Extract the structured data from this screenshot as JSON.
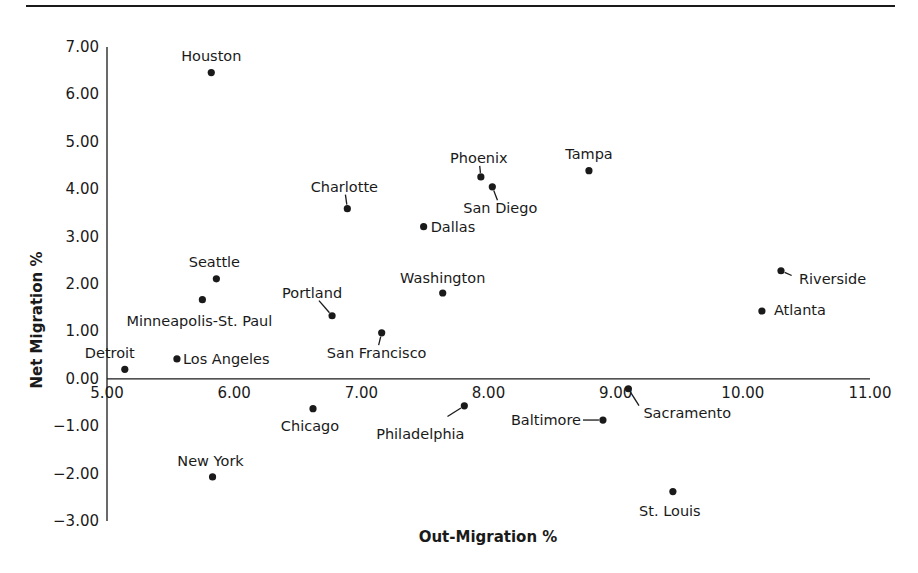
{
  "chart_data": {
    "type": "scatter",
    "title": "",
    "xlabel": "Out-Migration %",
    "ylabel": "Net Migration %",
    "xlim": [
      5.0,
      11.0
    ],
    "ylim": [
      -3.0,
      7.0
    ],
    "x_ticks": [
      "5.00",
      "6.00",
      "7.00",
      "8.00",
      "9.00",
      "10.00",
      "11.00"
    ],
    "y_ticks": [
      "7.00",
      "6.00",
      "5.00",
      "4.00",
      "3.00",
      "2.00",
      "1.00",
      "0.00",
      "-1.00",
      "-2.00",
      "-3.00"
    ],
    "grid": false,
    "legend": "none",
    "x_axis_crosses_at": 0.0,
    "points": [
      {
        "name": "Houston",
        "x": 5.82,
        "y": 6.46,
        "label_dx": 0,
        "label_dy": -12,
        "anchor": "middle",
        "leader": false
      },
      {
        "name": "Charlotte",
        "x": 6.89,
        "y": 3.59,
        "label_dx": -3,
        "label_dy": -17,
        "anchor": "middle",
        "leader": true
      },
      {
        "name": "Phoenix",
        "x": 7.94,
        "y": 4.26,
        "label_dx": -2,
        "label_dy": -14,
        "anchor": "middle",
        "leader": true
      },
      {
        "name": "San Diego",
        "x": 8.03,
        "y": 4.05,
        "label_dx": 8,
        "label_dy": 26,
        "anchor": "middle",
        "leader": true
      },
      {
        "name": "Tampa",
        "x": 8.79,
        "y": 4.39,
        "label_dx": 0,
        "label_dy": -12,
        "anchor": "middle",
        "leader": false
      },
      {
        "name": "Dallas",
        "x": 7.49,
        "y": 3.21,
        "label_dx": 7,
        "label_dy": 5,
        "anchor": "start",
        "leader": false
      },
      {
        "name": "Seattle",
        "x": 5.86,
        "y": 2.11,
        "label_dx": -2,
        "label_dy": -12,
        "anchor": "middle",
        "leader": false
      },
      {
        "name": "Washington",
        "x": 7.64,
        "y": 1.81,
        "label_dx": 0,
        "label_dy": -10,
        "anchor": "middle",
        "leader": false
      },
      {
        "name": "Riverside",
        "x": 10.3,
        "y": 2.28,
        "label_dx": 18,
        "label_dy": 13,
        "anchor": "start",
        "leader": true
      },
      {
        "name": "Minneapolis-St. Paul",
        "x": 5.75,
        "y": 1.67,
        "label_dx": -3,
        "label_dy": 26,
        "anchor": "middle",
        "leader": false
      },
      {
        "name": "Portland",
        "x": 6.77,
        "y": 1.33,
        "label_dx": -20,
        "label_dy": -18,
        "anchor": "middle",
        "leader": true
      },
      {
        "name": "Atlanta",
        "x": 10.15,
        "y": 1.43,
        "label_dx": 12,
        "label_dy": 4,
        "anchor": "start",
        "leader": true
      },
      {
        "name": "San Francisco",
        "x": 7.16,
        "y": 0.97,
        "label_dx": -5,
        "label_dy": 25,
        "anchor": "middle",
        "leader": true
      },
      {
        "name": "Detroit",
        "x": 5.14,
        "y": 0.2,
        "label_dx": -15,
        "label_dy": -11,
        "anchor": "middle",
        "leader": false
      },
      {
        "name": "Los Angeles",
        "x": 5.55,
        "y": 0.42,
        "label_dx": 6,
        "label_dy": 5,
        "anchor": "start",
        "leader": false
      },
      {
        "name": "Sacramento",
        "x": 9.1,
        "y": -0.21,
        "label_dx": 15,
        "label_dy": 29,
        "anchor": "start",
        "leader": true
      },
      {
        "name": "Chicago",
        "x": 6.62,
        "y": -0.63,
        "label_dx": -3,
        "label_dy": 22,
        "anchor": "middle",
        "leader": false
      },
      {
        "name": "Philadelphia",
        "x": 7.81,
        "y": -0.57,
        "label_dx": -44,
        "label_dy": 33,
        "anchor": "middle",
        "leader": true
      },
      {
        "name": "Baltimore",
        "x": 8.9,
        "y": -0.87,
        "label_dx": -57,
        "label_dy": 5,
        "anchor": "middle",
        "leader": true
      },
      {
        "name": "New York",
        "x": 5.83,
        "y": -2.07,
        "label_dx": -2,
        "label_dy": -11,
        "anchor": "middle",
        "leader": false
      },
      {
        "name": "St. Louis",
        "x": 9.45,
        "y": -2.38,
        "label_dx": -3,
        "label_dy": 24,
        "anchor": "middle",
        "leader": false
      }
    ]
  },
  "colors": {
    "ink": "#1a1a1a",
    "background": "#ffffff"
  }
}
